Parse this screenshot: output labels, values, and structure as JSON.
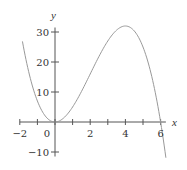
{
  "chart_data": {
    "type": "line",
    "title": "",
    "xlabel": "x",
    "ylabel": "y",
    "function": "y = x^2(6 - x)",
    "xlim": [
      -2,
      6.3
    ],
    "ylim": [
      -10,
      33
    ],
    "x_ticks": [
      -2,
      -1,
      0,
      1,
      2,
      3,
      4,
      5,
      6
    ],
    "x_tick_labels": [
      "-2",
      "0",
      "2",
      "4",
      "6"
    ],
    "x_tick_label_values": [
      -2,
      0,
      2,
      4,
      6
    ],
    "y_ticks": [
      -10,
      0,
      10,
      20,
      30
    ],
    "y_tick_labels": [
      "-10",
      "10",
      "20",
      "30"
    ],
    "y_tick_label_values": [
      -10,
      10,
      20,
      30
    ],
    "grid": false,
    "legend": null,
    "series": [
      {
        "name": "curve",
        "color": "#999999",
        "x": [
          -1.8,
          -1.5,
          -1,
          -0.5,
          0,
          0.5,
          1,
          1.5,
          2,
          2.5,
          3,
          3.5,
          4,
          4.5,
          5,
          5.5,
          6,
          6.3
        ],
        "y": [
          25.3,
          16.9,
          7,
          1.6,
          0,
          1.4,
          5,
          10.1,
          16,
          21.9,
          27,
          30.6,
          32,
          30.4,
          25,
          15.1,
          0,
          -11.1
        ]
      }
    ],
    "annotations": []
  },
  "colors": {
    "axis": "#555555",
    "curve": "#999999",
    "text": "#333333",
    "background": "#ffffff"
  }
}
